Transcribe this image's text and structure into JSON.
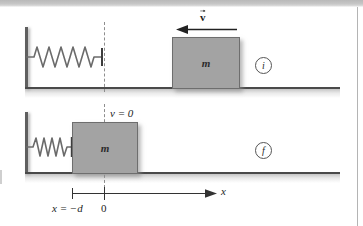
{
  "figure": {
    "panels": [
      {
        "stage_label": "i",
        "stage_meaning": "initial",
        "block_label": "m",
        "spring_state": "relaxed",
        "velocity": {
          "label": "v",
          "direction": "left",
          "has_vector_arrow": true
        }
      },
      {
        "stage_label": "f",
        "stage_meaning": "final",
        "block_label": "m",
        "spring_state": "compressed",
        "velocity": {
          "label": "v = 0",
          "direction": "none",
          "has_vector_arrow": false
        }
      }
    ],
    "axis": {
      "name": "x",
      "origin_label": "0",
      "left_tick_label": "x = −d",
      "arrow_direction": "right"
    },
    "colors": {
      "block_fill": "#a3a3a3",
      "block_stroke": "#6e6e6e",
      "wall": "#5f5f5f",
      "ground": "#4a4a4a",
      "dashed_guide": "#8e8e8e",
      "text": "#1d1d1d",
      "page_background": "#ffffff"
    }
  }
}
